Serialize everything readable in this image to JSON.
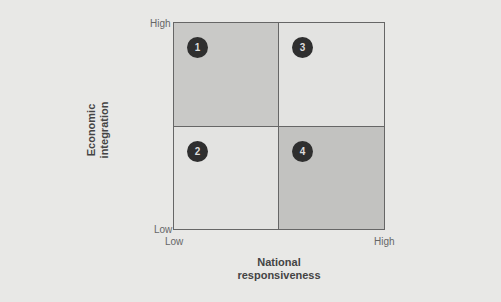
{
  "diagram": {
    "y_axis": {
      "label_line1": "Economic",
      "label_line2": "integration",
      "high": "High",
      "low": "Low"
    },
    "x_axis": {
      "label_line1": "National",
      "label_line2": "responsiveness",
      "low": "Low",
      "high": "High"
    },
    "quadrants": [
      {
        "number": "1",
        "position": "top-left",
        "color": "#c9c9c7"
      },
      {
        "number": "2",
        "position": "bottom-left",
        "color": "#e3e3e1"
      },
      {
        "number": "3",
        "position": "top-right",
        "color": "#e3e3e1"
      },
      {
        "number": "4",
        "position": "bottom-right",
        "color": "#c2c2c0"
      }
    ]
  }
}
